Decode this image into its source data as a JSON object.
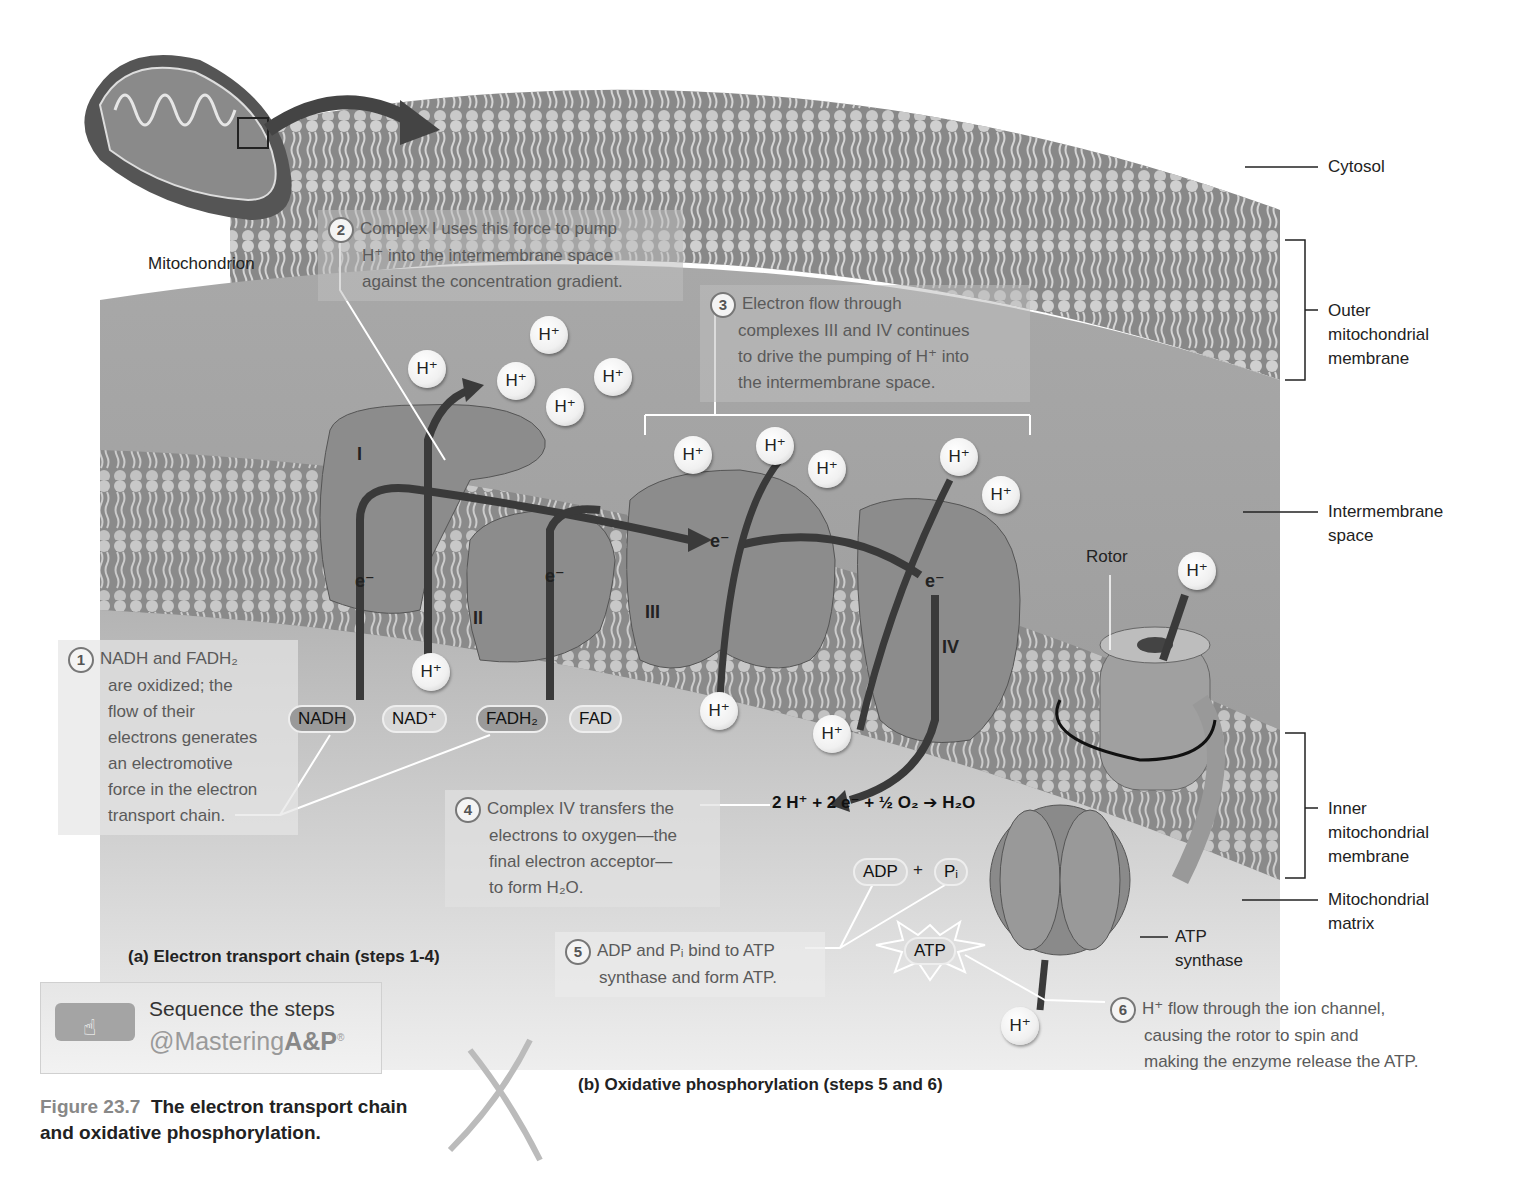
{
  "figure": {
    "number": "Figure 23.7",
    "title_line1": "The electron transport chain",
    "title_line2": "and oxidative phosphorylation.",
    "part_a": "(a) Electron transport chain (steps 1-4)",
    "part_b": "(b) Oxidative phosphorylation (steps 5 and 6)"
  },
  "mitochondrion_label": "Mitochondrion",
  "region_labels": {
    "cytosol": "Cytosol",
    "outer_membrane": [
      "Outer",
      "mitochondrial",
      "membrane"
    ],
    "intermembrane_space": [
      "Intermembrane",
      "space"
    ],
    "inner_membrane": [
      "Inner",
      "mitochondrial",
      "membrane"
    ],
    "matrix": [
      "Mitochondrial",
      "matrix"
    ]
  },
  "steps": [
    {
      "n": "1",
      "lines": [
        "NADH and FADH₂",
        "are oxidized; the",
        "flow of their",
        "electrons generates",
        "an electromotive",
        "force in the electron",
        "transport chain."
      ]
    },
    {
      "n": "2",
      "lines": [
        "Complex I uses this force to pump",
        "H⁺ into the intermembrane space",
        "against the concentration gradient."
      ]
    },
    {
      "n": "3",
      "lines": [
        "Electron flow through",
        "complexes III and IV continues",
        "to drive the pumping of H⁺ into",
        "the intermembrane space."
      ]
    },
    {
      "n": "4",
      "lines": [
        "Complex IV transfers the",
        "electrons to oxygen—the",
        "final electron acceptor—",
        "to form H₂O."
      ]
    },
    {
      "n": "5",
      "lines": [
        "ADP and Pᵢ bind to ATP",
        "synthase and form ATP."
      ]
    },
    {
      "n": "6",
      "lines": [
        "H⁺ flow through the ion channel,",
        "causing the rotor to spin and",
        "making the enzyme release the ATP."
      ]
    }
  ],
  "complexes": [
    "I",
    "II",
    "III",
    "IV"
  ],
  "molecules": {
    "nadh": "NADH",
    "nad": "NAD⁺",
    "fadh2": "FADH₂",
    "fad": "FAD",
    "adp": "ADP",
    "pi": "Pᵢ",
    "plus": "+",
    "atp": "ATP",
    "electron": "e⁻",
    "proton": "H⁺"
  },
  "equation": "2 H⁺ + 2 e⁻ + ½ O₂ ➔ H₂O",
  "rotor_label": "Rotor",
  "atp_synthase_label": [
    "ATP",
    "synthase"
  ],
  "mastering": {
    "line1": "Sequence the steps",
    "line2_prefix": "@Mastering",
    "line2_brand": "A&P",
    "reg": "®"
  },
  "colors": {
    "membrane": "#8c8c8c",
    "intermembrane": "#9e9e9e",
    "protein": "#8a8a8a",
    "arrow": "#3a3a3a"
  }
}
